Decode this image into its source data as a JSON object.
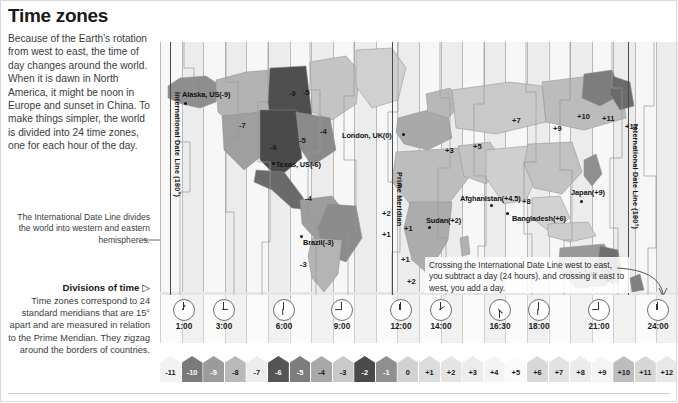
{
  "title": "Time zones",
  "intro": "Because of the Earth's rotation from west to east, the time of day changes around the world. When it is dawn in North America, it might be noon in Europe and sunset in China. To make things simpler, the world is divided into 24 time zones, one for each hour of the day.",
  "idl_note": "The International Date Line divides the world into western and eastern hemispheres.",
  "divisions": {
    "heading": "Divisions of time",
    "heading_marker": "▷",
    "body": "Time zones correspond to 24 standard meridians that are 15° apart and are measured in relation to the Prime Meridian. They zigzag around the borders of countries."
  },
  "map": {
    "top_labels": [
      {
        "text": "Later in the day",
        "x": 72
      },
      {
        "text": "Midday",
        "x": 228
      },
      {
        "text": "Earlier in the day",
        "x": 340
      }
    ],
    "vertical_labels": [
      {
        "text": "International Date Line (180°)",
        "x": 12,
        "y": 50
      },
      {
        "text": "Prime Meridian",
        "x": 234,
        "y": 130
      },
      {
        "text": "International Date Line (180°)",
        "x": 470,
        "y": 82
      }
    ],
    "city_labels": [
      {
        "text": "Alaska, US(-9)",
        "x": 22,
        "y": 48,
        "dotx": 24,
        "doty": 60
      },
      {
        "text": "Texas, US(-6)",
        "x": 116,
        "y": 118,
        "dotx": 112,
        "doty": 120
      },
      {
        "text": "London, UK(0)",
        "x": 182,
        "y": 89,
        "dotx": 242,
        "doty": 91
      },
      {
        "text": "Brazil(-3)",
        "x": 143,
        "y": 196,
        "dotx": 140,
        "doty": 193
      },
      {
        "text": "Afghanistan(+4.5)",
        "x": 300,
        "y": 152,
        "dotx": 330,
        "doty": 162
      },
      {
        "text": "Sudan(+2)",
        "x": 266,
        "y": 174,
        "dotx": 268,
        "doty": 184
      },
      {
        "text": "Bangladesh(+6)",
        "x": 352,
        "y": 172,
        "dotx": 346,
        "doty": 170
      },
      {
        "text": "Japan(+9)",
        "x": 411,
        "y": 146,
        "dotx": 420,
        "doty": 158
      }
    ],
    "zone_numbers": [
      {
        "text": "-9",
        "x": 129,
        "y": 47
      },
      {
        "text": "-7",
        "x": 79,
        "y": 79
      },
      {
        "text": "-5",
        "x": 139,
        "y": 94
      },
      {
        "text": "-6",
        "x": 110,
        "y": 101
      },
      {
        "text": "-4",
        "x": 160,
        "y": 85
      },
      {
        "text": "-5",
        "x": 143,
        "y": 46
      },
      {
        "text": "-4",
        "x": 145,
        "y": 152
      },
      {
        "text": "-3",
        "x": 140,
        "y": 218
      },
      {
        "text": "0",
        "x": 238,
        "y": 139
      },
      {
        "text": "+1",
        "x": 244,
        "y": 182
      },
      {
        "text": "+1",
        "x": 241,
        "y": 213
      },
      {
        "text": "+2",
        "x": 247,
        "y": 235
      },
      {
        "text": "+2",
        "x": 222,
        "y": 167
      },
      {
        "text": "+1",
        "x": 222,
        "y": 188
      },
      {
        "text": "+3",
        "x": 285,
        "y": 104
      },
      {
        "text": "+5",
        "x": 313,
        "y": 100
      },
      {
        "text": "+7",
        "x": 352,
        "y": 74
      },
      {
        "text": "+9",
        "x": 393,
        "y": 82
      },
      {
        "text": "+10",
        "x": 417,
        "y": 70
      },
      {
        "text": "+11",
        "x": 442,
        "y": 72
      },
      {
        "text": "+12",
        "x": 465,
        "y": 80
      },
      {
        "text": "+8",
        "x": 362,
        "y": 155
      },
      {
        "text": "+8",
        "x": 404,
        "y": 228
      },
      {
        "text": "+9.5",
        "x": 424,
        "y": 228
      },
      {
        "text": "+10",
        "x": 446,
        "y": 234
      }
    ],
    "idl_callout": "Crossing the International Date Line west to east, you subtract a day (24 hours), and crossing it east to west, you add a day."
  },
  "clocks": [
    {
      "time": "1:00",
      "x": 4,
      "hour": 1,
      "minute": 0
    },
    {
      "time": "3:00",
      "x": 44,
      "hour": 3,
      "minute": 0
    },
    {
      "time": "6:00",
      "x": 104,
      "hour": 6,
      "minute": 0
    },
    {
      "time": "9:00",
      "x": 162,
      "hour": 9,
      "minute": 0
    },
    {
      "time": "12:00",
      "x": 221,
      "hour": 12,
      "minute": 0
    },
    {
      "time": "14:00",
      "x": 261,
      "hour": 14,
      "minute": 0
    },
    {
      "time": "16:30",
      "x": 320,
      "hour": 16,
      "minute": 30
    },
    {
      "time": "18:00",
      "x": 359,
      "hour": 18,
      "minute": 0
    },
    {
      "time": "21:00",
      "x": 419,
      "hour": 21,
      "minute": 0
    },
    {
      "time": "24:00",
      "x": 478,
      "hour": 24,
      "minute": 0
    }
  ],
  "legend": {
    "items": [
      {
        "label": "-11",
        "color": "#f2f2f2",
        "text_color": "#1a1a1a"
      },
      {
        "label": "-10",
        "color": "#7a7a7a",
        "text_color": "#ffffff"
      },
      {
        "label": "-9",
        "color": "#9b9b9b",
        "text_color": "#ffffff"
      },
      {
        "label": "-8",
        "color": "#b9b9b9",
        "text_color": "#1a1a1a"
      },
      {
        "label": "-7",
        "color": "#ededed",
        "text_color": "#1a1a1a"
      },
      {
        "label": "-6",
        "color": "#555555",
        "text_color": "#ffffff"
      },
      {
        "label": "-5",
        "color": "#7d7d7d",
        "text_color": "#ffffff"
      },
      {
        "label": "-4",
        "color": "#a8a8a8",
        "text_color": "#1a1a1a"
      },
      {
        "label": "-3",
        "color": "#c9c9c9",
        "text_color": "#1a1a1a"
      },
      {
        "label": "-2",
        "color": "#4a4a4a",
        "text_color": "#ffffff"
      },
      {
        "label": "-1",
        "color": "#8f8f8f",
        "text_color": "#ffffff"
      },
      {
        "label": "0",
        "color": "#d2d2d2",
        "text_color": "#1a1a1a"
      },
      {
        "label": "+1",
        "color": "#dcdcdc",
        "text_color": "#1a1a1a"
      },
      {
        "label": "+2",
        "color": "#e4e4e4",
        "text_color": "#1a1a1a"
      },
      {
        "label": "+3",
        "color": "#ececec",
        "text_color": "#1a1a1a"
      },
      {
        "label": "+4",
        "color": "#f4f4f4",
        "text_color": "#1a1a1a"
      },
      {
        "label": "+5",
        "color": "#fafafa",
        "text_color": "#1a1a1a"
      },
      {
        "label": "+6",
        "color": "#d8d8d8",
        "text_color": "#1a1a1a"
      },
      {
        "label": "+7",
        "color": "#e2e2e2",
        "text_color": "#1a1a1a"
      },
      {
        "label": "+8",
        "color": "#ebebeb",
        "text_color": "#1a1a1a"
      },
      {
        "label": "+9",
        "color": "#f5f5f5",
        "text_color": "#1a1a1a"
      },
      {
        "label": "+10",
        "color": "#bdbdbd",
        "text_color": "#1a1a1a"
      },
      {
        "label": "+11",
        "color": "#d6d6d6",
        "text_color": "#1a1a1a"
      },
      {
        "label": "+12",
        "color": "#e8e8e8",
        "text_color": "#1a1a1a"
      }
    ]
  },
  "chart_data": {
    "type": "map",
    "title": "Time zones",
    "categories": [
      "-11",
      "-10",
      "-9",
      "-8",
      "-7",
      "-6",
      "-5",
      "-4",
      "-3",
      "-2",
      "-1",
      "0",
      "+1",
      "+2",
      "+3",
      "+4",
      "+5",
      "+6",
      "+7",
      "+8",
      "+9",
      "+10",
      "+11",
      "+12"
    ],
    "values": [
      -11,
      -10,
      -9,
      -8,
      -7,
      -6,
      -5,
      -4,
      -3,
      -2,
      -1,
      0,
      1,
      2,
      3,
      4,
      5,
      6,
      7,
      8,
      9,
      10,
      11,
      12
    ],
    "annotated_places": [
      {
        "place": "Alaska, US",
        "offset": -9
      },
      {
        "place": "Texas, US",
        "offset": -6
      },
      {
        "place": "Brazil",
        "offset": -3
      },
      {
        "place": "London, UK",
        "offset": 0
      },
      {
        "place": "Sudan",
        "offset": 2
      },
      {
        "place": "Afghanistan",
        "offset": 4.5
      },
      {
        "place": "Bangladesh",
        "offset": 6
      },
      {
        "place": "Japan",
        "offset": 9
      }
    ],
    "clock_times": [
      "1:00",
      "3:00",
      "6:00",
      "9:00",
      "12:00",
      "14:00",
      "16:30",
      "18:00",
      "21:00",
      "24:00"
    ],
    "xlabel": "",
    "ylabel": "",
    "legend_position": "bottom"
  }
}
